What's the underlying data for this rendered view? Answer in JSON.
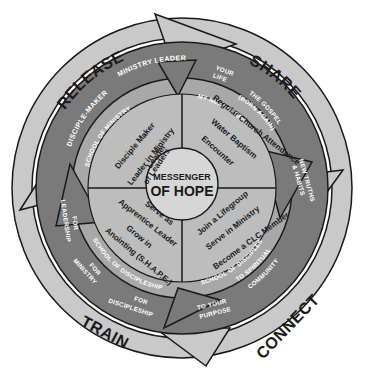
{
  "diagram": {
    "title": "Messenger of Hope",
    "center": {
      "line1": "MESSENGER",
      "line2": "OF HOPE"
    },
    "colors": {
      "outer_ring": "#c9c9c9",
      "middle_ring": "#7a7a7a",
      "school_band": "#a8a8a8",
      "quadrant_fill": "#bdbdbd",
      "center": "#d6d6d6",
      "outline": "#1a1a1a",
      "light_text": "#ffffff",
      "dark_text": "#1a1a1a"
    },
    "stages": {
      "share": "SHARE",
      "connect": "CONNECT",
      "train": "TRAIN",
      "release": "RELEASE"
    },
    "outer_band_labels": {
      "share_your_life": [
        "YOUR",
        "LIFE"
      ],
      "share_the_gospel": [
        "THE GOSPEL",
        "(BORN AGAIN)"
      ],
      "share_new_truths": [
        "NEW TRUTHS",
        "& HABITS"
      ],
      "connect_spiritual": [
        "TO SPIRITUAL",
        "COMMUNITY"
      ],
      "connect_purpose": [
        "TO YOUR",
        "PURPOSE"
      ],
      "train_discipleship": [
        "FOR",
        "DISCIPLESHIP"
      ],
      "train_ministry": [
        "FOR",
        "MINISTRY"
      ],
      "train_leadership": [
        "FOR",
        "LEADERSHIP"
      ],
      "release_disciple_maker": "DISCIPLE-MAKER",
      "release_ministry_leader": "MINISTRY LEADER"
    },
    "school_band_labels": {
      "top_right": "MY NEXT STEPS",
      "bottom_right": "SCHOOL OF DISCIPLESHIP",
      "bottom_left": "SCHOOL OF DISCIPLESHIP",
      "top_left": "SCHOOL OF MINISTRY"
    },
    "quadrants": {
      "top_right": [
        "Regular Church Attendance",
        "Water Baptism",
        "Encounter"
      ],
      "bottom_right": [
        "Join a Lifegroup",
        "Serve in Ministry",
        "Become a CLC Member"
      ],
      "bottom_left": [
        "Serve as",
        "Apprentice Leader",
        "Grow in",
        "Anointing (S.H.A.P.E.)"
      ],
      "top_left": [
        "Disciple Maker",
        "Leader in Ministry",
        "Leader",
        "of Leaders"
      ]
    }
  }
}
